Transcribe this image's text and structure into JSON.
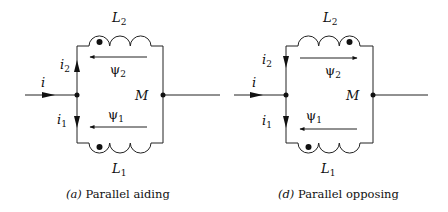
{
  "diagrams": [
    {
      "id": "a",
      "caption_letter": "(a)",
      "caption_text": " Parallel aiding",
      "labels": {
        "top_inductor": "L",
        "top_inductor_sub": "2",
        "bottom_inductor": "L",
        "bottom_inductor_sub": "1",
        "input_current": "i",
        "branch_current_top": "i",
        "branch_current_top_sub": "2",
        "branch_current_bottom": "i",
        "branch_current_bottom_sub": "1",
        "flux_top": "ψ",
        "flux_top_sub": "2",
        "flux_bottom": "ψ",
        "flux_bottom_sub": "1",
        "mutual": "M"
      },
      "flux_top_direction": "left",
      "flux_bottom_direction": "left",
      "top_dot_position": "left",
      "bottom_dot_position": "left",
      "i2_direction": "up"
    },
    {
      "id": "d",
      "caption_letter": "(d)",
      "caption_text": " Parallel opposing",
      "labels": {
        "top_inductor": "L",
        "top_inductor_sub": "2",
        "bottom_inductor": "L",
        "bottom_inductor_sub": "1",
        "input_current": "i",
        "branch_current_top": "i",
        "branch_current_top_sub": "2",
        "branch_current_bottom": "i",
        "branch_current_bottom_sub": "1",
        "flux_top": "ψ",
        "flux_top_sub": "2",
        "flux_bottom": "ψ",
        "flux_bottom_sub": "1",
        "mutual": "M"
      },
      "flux_top_direction": "right",
      "flux_bottom_direction": "left",
      "top_dot_position": "right",
      "bottom_dot_position": "left",
      "i2_direction": "down"
    }
  ],
  "colors": {
    "line": "#222222",
    "background": "#ffffff"
  }
}
